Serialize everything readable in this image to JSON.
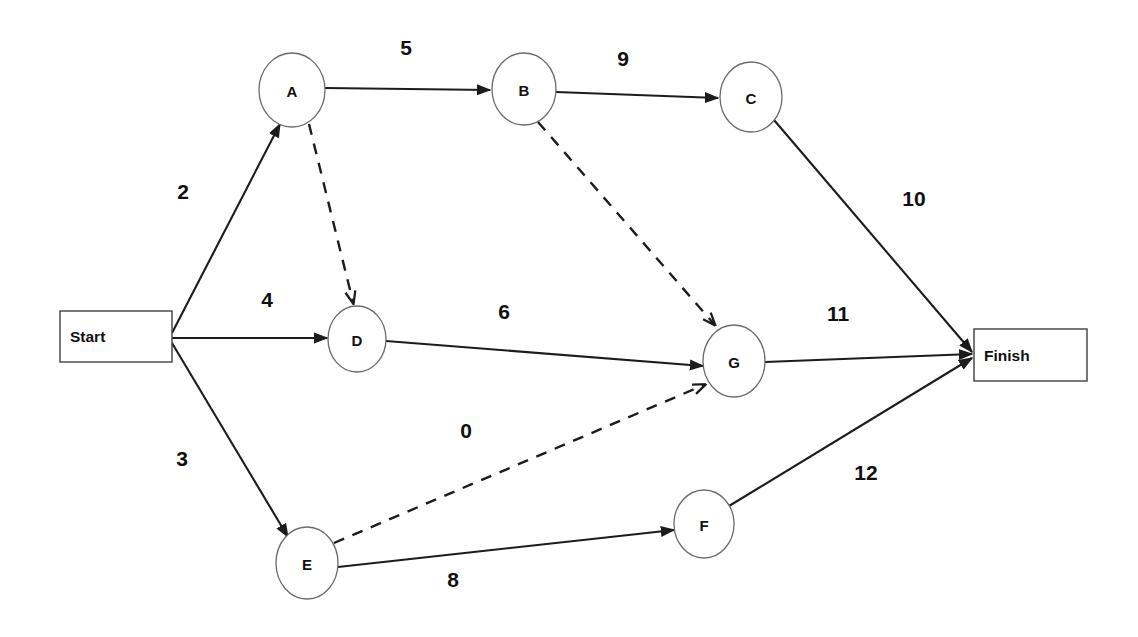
{
  "diagram": {
    "background_color": "#ffffff",
    "line_color": "#1c1c1c",
    "node_stroke_color": "#6b6b6b",
    "terminators": [
      {
        "id": "start",
        "label": "Start",
        "x": 60,
        "y": 311,
        "w": 112,
        "h": 51
      },
      {
        "id": "finish",
        "label": "Finish",
        "x": 974,
        "y": 329,
        "w": 113,
        "h": 52
      }
    ],
    "nodes": [
      {
        "id": "A",
        "label": "A",
        "cx": 292,
        "cy": 90,
        "rx": 33,
        "ry": 37
      },
      {
        "id": "B",
        "label": "B",
        "cx": 524,
        "cy": 89,
        "rx": 32,
        "ry": 36
      },
      {
        "id": "C",
        "label": "C",
        "cx": 751,
        "cy": 97,
        "rx": 31,
        "ry": 35
      },
      {
        "id": "D",
        "label": "D",
        "cx": 357,
        "cy": 339,
        "rx": 29,
        "ry": 33
      },
      {
        "id": "E",
        "label": "E",
        "cx": 307,
        "cy": 563,
        "rx": 31,
        "ry": 36
      },
      {
        "id": "F",
        "label": "F",
        "cx": 704,
        "cy": 524,
        "rx": 30,
        "ry": 34
      },
      {
        "id": "G",
        "label": "G",
        "cx": 734,
        "cy": 361,
        "rx": 31,
        "ry": 36
      }
    ],
    "edges": [
      {
        "id": "start-a",
        "from": "Start",
        "to": "A",
        "style": "solid",
        "weight": "2",
        "label_x": 183,
        "label_y": 191,
        "x1": 172,
        "y1": 333,
        "x2": 280,
        "y2": 124,
        "arrow": true
      },
      {
        "id": "a-b",
        "from": "A",
        "to": "B",
        "style": "solid",
        "weight": "5",
        "label_x": 406,
        "label_y": 47,
        "x1": 325,
        "y1": 88,
        "x2": 490,
        "y2": 90,
        "arrow": true
      },
      {
        "id": "b-c",
        "from": "B",
        "to": "C",
        "style": "solid",
        "weight": "9",
        "label_x": 623,
        "label_y": 58,
        "x1": 556,
        "y1": 92,
        "x2": 718,
        "y2": 98,
        "arrow": true
      },
      {
        "id": "c-finish",
        "from": "C",
        "to": "Finish",
        "style": "solid",
        "weight": "10",
        "label_x": 914,
        "label_y": 198,
        "x1": 774,
        "y1": 120,
        "x2": 972,
        "y2": 352,
        "arrow": true
      },
      {
        "id": "start-d",
        "from": "Start",
        "to": "D",
        "style": "solid",
        "weight": "4",
        "label_x": 267,
        "label_y": 299,
        "x1": 172,
        "y1": 338,
        "x2": 327,
        "y2": 338,
        "arrow": true
      },
      {
        "id": "d-g",
        "from": "D",
        "to": "G",
        "style": "solid",
        "weight": "6",
        "label_x": 504,
        "label_y": 311,
        "x1": 386,
        "y1": 341,
        "x2": 703,
        "y2": 366,
        "arrow": true
      },
      {
        "id": "g-finish",
        "from": "G",
        "to": "Finish",
        "style": "solid",
        "weight": "11",
        "label_x": 838,
        "label_y": 313,
        "x1": 765,
        "y1": 362,
        "x2": 972,
        "y2": 354,
        "arrow": true
      },
      {
        "id": "start-e",
        "from": "Start",
        "to": "E",
        "style": "solid",
        "weight": "3",
        "label_x": 182,
        "label_y": 458,
        "x1": 172,
        "y1": 343,
        "x2": 288,
        "y2": 537,
        "arrow": true
      },
      {
        "id": "e-f",
        "from": "E",
        "to": "F",
        "style": "solid",
        "weight": "8",
        "label_x": 453,
        "label_y": 579,
        "x1": 338,
        "y1": 567,
        "x2": 674,
        "y2": 530,
        "arrow": true
      },
      {
        "id": "f-finish",
        "from": "F",
        "to": "Finish",
        "style": "solid",
        "weight": "12",
        "label_x": 866,
        "label_y": 472,
        "x1": 729,
        "y1": 506,
        "x2": 972,
        "y2": 358,
        "arrow": true
      },
      {
        "id": "a-d",
        "from": "A",
        "to": "D",
        "style": "dashed",
        "weight": "",
        "label_x": 0,
        "label_y": 0,
        "x1": 309,
        "y1": 124,
        "x2": 353,
        "y2": 302,
        "arrow": true
      },
      {
        "id": "b-g",
        "from": "B",
        "to": "G",
        "style": "dashed",
        "weight": "",
        "label_x": 0,
        "label_y": 0,
        "x1": 538,
        "y1": 122,
        "x2": 714,
        "y2": 324,
        "arrow": true
      },
      {
        "id": "e-g",
        "from": "E",
        "to": "G",
        "style": "dashed",
        "weight": "0",
        "label_x": 466,
        "label_y": 430,
        "x1": 334,
        "y1": 543,
        "x2": 704,
        "y2": 385,
        "arrow": true
      }
    ]
  }
}
